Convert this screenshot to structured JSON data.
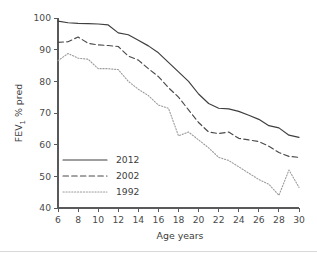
{
  "figure": {
    "title": "",
    "background_color": "#ffffff",
    "axis_color": "#58595b"
  },
  "axes": {
    "y_label_main": "FEV",
    "y_label_sub": "1",
    "y_label_tail": " % pred",
    "x_label": "Age years",
    "y_ticks": [
      "40",
      "50",
      "60",
      "70",
      "80",
      "90",
      "100"
    ],
    "x_ticks": [
      "6",
      "8",
      "10",
      "12",
      "14",
      "16",
      "18",
      "20",
      "22",
      "24",
      "26",
      "28",
      "30"
    ]
  },
  "legend": {
    "position": "lower-left",
    "entries": [
      {
        "label": "2012",
        "style": "solid",
        "color": "#3f3f3f"
      },
      {
        "label": "2002",
        "style": "dashed",
        "color": "#4a4a4a"
      },
      {
        "label": "1992",
        "style": "dotted",
        "color": "#9b9b9b"
      }
    ]
  },
  "chart_data": {
    "type": "line",
    "title": "",
    "subtitle": "",
    "xlabel": "Age years",
    "ylabel": "FEV1 % pred",
    "xlim": [
      6,
      30
    ],
    "ylim": [
      40,
      100
    ],
    "xtick_step": 2,
    "ytick_step": 10,
    "grid": false,
    "legend_position": "lower-left",
    "x": [
      6,
      7,
      8,
      9,
      10,
      11,
      12,
      13,
      14,
      15,
      16,
      17,
      18,
      19,
      20,
      21,
      22,
      23,
      24,
      25,
      26,
      27,
      28,
      29,
      30
    ],
    "series": [
      {
        "name": "2012",
        "style": "solid",
        "color": "#3f3f3f",
        "values": [
          99.0,
          98.5,
          98.3,
          98.2,
          98.1,
          97.8,
          95.3,
          94.7,
          93.0,
          91.2,
          89.0,
          86.0,
          83.0,
          80.0,
          76.0,
          73.0,
          71.5,
          71.3,
          70.5,
          69.3,
          68.0,
          66.0,
          65.3,
          63.0,
          62.3
        ]
      },
      {
        "name": "2002",
        "style": "dashed",
        "color": "#4a4a4a",
        "values": [
          92.3,
          92.5,
          94.0,
          92.0,
          91.5,
          91.3,
          91.0,
          88.0,
          86.7,
          84.0,
          81.5,
          78.0,
          75.0,
          71.0,
          67.0,
          64.0,
          63.5,
          64.0,
          62.0,
          61.5,
          61.0,
          59.5,
          57.5,
          56.3,
          56.0
        ]
      },
      {
        "name": "1992",
        "style": "dotted",
        "color": "#9b9b9b",
        "values": [
          86.5,
          88.8,
          87.3,
          87.0,
          84.0,
          84.0,
          83.7,
          80.0,
          77.5,
          75.5,
          72.5,
          71.5,
          62.8,
          64.0,
          61.5,
          59.0,
          56.0,
          55.0,
          53.0,
          51.0,
          49.0,
          47.5,
          44.0,
          52.0,
          46.5
        ]
      }
    ],
    "series_tail_note": {
      "2002": [
        56.0,
        53.3,
        53.5,
        55.8,
        54.0,
        50.5,
        55.0
      ],
      "1992": [
        44.0,
        52.0,
        46.5,
        42.0,
        41.5,
        44.5,
        45.5,
        42.5,
        41.0
      ]
    }
  },
  "chart_paths": {
    "2012": "99.0,98.6,98.4,98.3,98.2,97.9,95.4,94.8,93.2,91.4,89.2,86.2,83.2,80.0,76.2,73.2,71.6,71.4,70.8,69.6,68.2,66.2,65.4,63.2,62.4",
    "2002": "92.3,92.6,94.1,92.2,91.6,91.4,91.1,88.2,86.8,84.2,81.6,78.2,75.2,71.2,67.2,64.2,63.6,64.1,62.2,61.6,61.2,59.6,57.6,56.4,56.1",
    "1992": "86.5,88.9,87.4,87.1,84.1,84.1,83.8,80.2,77.6,75.6,72.6,71.6,62.9,64.1,61.6,59.2,56.2,55.2,53.2,51.2,49.2,47.6,44.2,52.2,46.6"
  }
}
